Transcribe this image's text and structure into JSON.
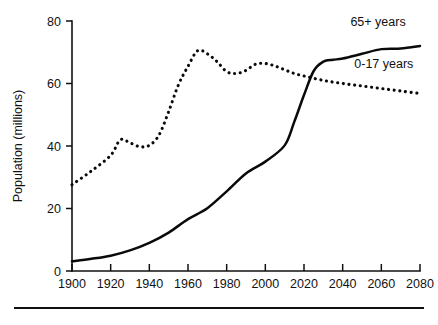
{
  "chart_data": {
    "type": "line",
    "title": "",
    "subtitle": "",
    "xlabel": "",
    "ylabel": "Population (millions)",
    "xlim": [
      1900,
      2080
    ],
    "ylim": [
      0,
      80
    ],
    "grid": false,
    "legend_position": "inline-right",
    "x_ticks": [
      1900,
      1920,
      1940,
      1960,
      1980,
      2000,
      2020,
      2040,
      2060,
      2080
    ],
    "x_tick_labels": [
      "1900",
      "1920",
      "1940",
      "1960",
      "1980",
      "2000",
      "2020",
      "2040",
      "2060",
      "2080"
    ],
    "y_ticks": [
      0,
      20,
      40,
      60,
      80
    ],
    "y_tick_labels": [
      "0",
      "20",
      "40",
      "60",
      "80"
    ],
    "series": [
      {
        "name": "65+ years",
        "style": "solid",
        "label": "65+ years",
        "x": [
          1900,
          1910,
          1920,
          1930,
          1940,
          1950,
          1960,
          1970,
          1980,
          1990,
          2000,
          2010,
          2015,
          2020,
          2025,
          2030,
          2035,
          2040,
          2050,
          2060,
          2070,
          2080
        ],
        "values": [
          3.1,
          3.9,
          4.9,
          6.6,
          9.0,
          12.3,
          16.6,
          20.1,
          25.5,
          31.2,
          35.0,
          40.2,
          47.8,
          56.3,
          64.0,
          67.0,
          67.6,
          68.0,
          69.5,
          71.0,
          71.2,
          72.0
        ]
      },
      {
        "name": "0-17 years",
        "style": "dotted",
        "label": "0-17 years",
        "x": [
          1900,
          1910,
          1920,
          1925,
          1930,
          1935,
          1940,
          1945,
          1950,
          1955,
          1960,
          1965,
          1970,
          1975,
          1980,
          1985,
          1990,
          1995,
          2000,
          2005,
          2010,
          2015,
          2020,
          2030,
          2040,
          2050,
          2060,
          2070,
          2080
        ],
        "values": [
          27.6,
          32.0,
          37.0,
          42.0,
          41.0,
          39.8,
          40.2,
          43.5,
          51.0,
          59.5,
          65.5,
          70.5,
          69.5,
          67.0,
          63.8,
          63.2,
          64.2,
          66.2,
          66.4,
          65.6,
          64.4,
          63.2,
          62.4,
          61.0,
          60.0,
          59.2,
          58.4,
          57.6,
          56.8
        ]
      }
    ],
    "series_label_positions": [
      {
        "series": "65+ years",
        "x": 2044,
        "y": 78.5
      },
      {
        "series": "0-17 years",
        "x": 2046,
        "y": 65.0
      }
    ]
  }
}
